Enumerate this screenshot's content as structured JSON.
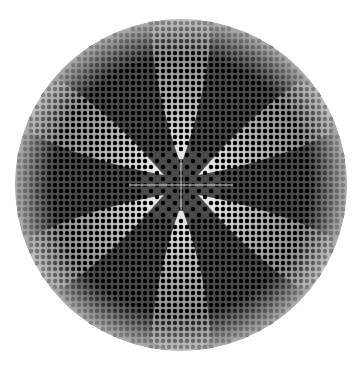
{
  "figure": {
    "description": "Circular dot-grid pattern with a six-petal flower shape",
    "canvas": {
      "width": 362,
      "height": 368,
      "background": "#ffffff"
    },
    "disc": {
      "cx": 181,
      "cy": 185,
      "r": 166,
      "fill": "#4a4a4a"
    },
    "grid": {
      "spacing": 6,
      "dot_radius": 2.2,
      "dot_color": "#000000",
      "origin_x": 181,
      "origin_y": 185
    },
    "petals": {
      "color": "#ffffff",
      "count": 6,
      "angles_deg": [
        90,
        150,
        210,
        270,
        330,
        30
      ],
      "inner_radius": 20,
      "outer_radius": 160,
      "half_width_deg": 11
    },
    "rim_fade": {
      "color": "#ffffff",
      "width": 38
    },
    "center_cross": {
      "color": "#d8d8d8",
      "length": 52
    }
  }
}
